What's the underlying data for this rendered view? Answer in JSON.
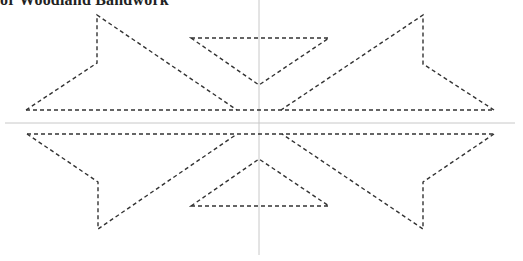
{
  "title": "or Woodland Bandwork",
  "colors": {
    "line": "#333333",
    "axis": "#c8c8c8",
    "background": "#ffffff"
  },
  "axes": {
    "horizontal": {
      "x1": 5,
      "y1": 123,
      "x2": 515,
      "y2": 123
    },
    "vertical": {
      "x1": 259,
      "y1": 0,
      "x2": 259,
      "y2": 255
    }
  },
  "shapes": [
    {
      "name": "upper-left-shape",
      "points": "26,110 97,63 97,15 237,110"
    },
    {
      "name": "upper-right-shape",
      "points": "494,110 423,64 423,15 281,110"
    },
    {
      "name": "upper-center-triangle",
      "points": "191,38 329,38 259,85"
    },
    {
      "name": "lower-left-shape",
      "points": "27,134 98,182 98,229 237,134"
    },
    {
      "name": "lower-right-shape",
      "points": "494,134 423,182 423,229 282,134"
    },
    {
      "name": "lower-center-triangle",
      "points": "191,206 329,206 259,159"
    }
  ],
  "baselines": [
    {
      "name": "upper-baseline",
      "x1": 26,
      "y1": 110,
      "x2": 494,
      "y2": 110
    },
    {
      "name": "lower-baseline",
      "x1": 27,
      "y1": 134,
      "x2": 494,
      "y2": 134
    }
  ]
}
